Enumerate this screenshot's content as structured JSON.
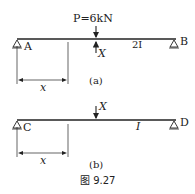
{
  "figure": {
    "caption": "图 9.27",
    "panel_a": {
      "label": "(a)",
      "load": "P=6kN",
      "unknown_force": "X",
      "stiffness": "2I",
      "support_left": "A",
      "support_right": "B",
      "dimension": "x"
    },
    "panel_b": {
      "label": "(b)",
      "unknown_force": "X",
      "stiffness": "I",
      "support_left": "C",
      "support_right": "D",
      "dimension": "x"
    }
  }
}
